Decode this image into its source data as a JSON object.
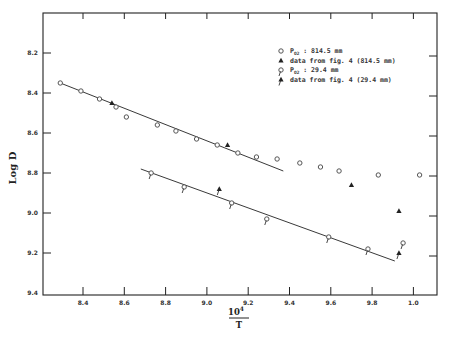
{
  "chart_data": {
    "type": "scatter",
    "title": "",
    "xlabel": "10^4 / T",
    "ylabel": "Log D",
    "xlim": [
      8.23,
      10.14
    ],
    "ylim": [
      9.4,
      8.0
    ],
    "y_inverted": true,
    "x_ticks": [
      "8.4",
      "8.6",
      "8.8",
      "9.0",
      "9.2",
      "9.4",
      "9.6",
      "9.8",
      "1.0"
    ],
    "x_tick_values": [
      8.4,
      8.6,
      8.8,
      9.0,
      9.2,
      9.4,
      9.6,
      9.8,
      10.0
    ],
    "y_ticks": [
      "8.2",
      "8.4",
      "8.6",
      "8.8",
      "9.0",
      "9.2",
      "9.4"
    ],
    "y_tick_values": [
      8.2,
      8.4,
      8.6,
      8.8,
      9.0,
      9.2,
      9.4
    ],
    "grid": false,
    "legend_position": "upper right",
    "series": [
      {
        "name": "P_O2 : 814.5 mm",
        "marker": "open-circle",
        "points": [
          [
            8.29,
            8.35
          ],
          [
            8.39,
            8.39
          ],
          [
            8.48,
            8.43
          ],
          [
            8.56,
            8.47
          ],
          [
            8.61,
            8.52
          ],
          [
            8.76,
            8.56
          ],
          [
            8.85,
            8.59
          ],
          [
            8.95,
            8.63
          ],
          [
            9.05,
            8.66
          ],
          [
            9.15,
            8.7
          ],
          [
            9.24,
            8.72
          ],
          [
            9.34,
            8.73
          ],
          [
            9.45,
            8.75
          ],
          [
            9.55,
            8.77
          ],
          [
            9.64,
            8.79
          ],
          [
            9.83,
            8.81
          ],
          [
            10.03,
            8.81
          ]
        ]
      },
      {
        "name": "data from fig. 4 (814.5 mm)",
        "marker": "filled-triangle",
        "points": [
          [
            8.54,
            8.45
          ],
          [
            9.1,
            8.66
          ],
          [
            9.7,
            8.86
          ],
          [
            9.93,
            8.99
          ]
        ]
      },
      {
        "name": "P_O2 : 29.4 mm",
        "marker": "open-circle-flag",
        "points": [
          [
            8.73,
            8.8
          ],
          [
            8.89,
            8.87
          ],
          [
            9.12,
            8.95
          ],
          [
            9.29,
            9.03
          ],
          [
            9.59,
            9.12
          ],
          [
            9.78,
            9.18
          ],
          [
            9.95,
            9.15
          ]
        ]
      },
      {
        "name": "data from fig. 4 (29.4 mm)",
        "marker": "filled-triangle-flag",
        "points": [
          [
            9.06,
            8.88
          ],
          [
            9.93,
            9.2
          ]
        ]
      }
    ],
    "fit_lines": [
      {
        "name": "fit 814.5 mm",
        "from": [
          8.29,
          8.35
        ],
        "to": [
          9.37,
          8.79
        ]
      },
      {
        "name": "fit 29.4 mm",
        "from": [
          8.68,
          8.78
        ],
        "to": [
          9.91,
          9.24
        ]
      }
    ]
  },
  "axes": {
    "ylabel": "Log D",
    "xlabel_num": "10",
    "xlabel_exp": "4",
    "xlabel_den": "T"
  },
  "legend": {
    "items": [
      {
        "prefix": "P",
        "sub": "O2",
        "text": " : 814.5 mm"
      },
      {
        "prefix": "",
        "sub": "",
        "text": "data from fig. 4  (814.5 mm)"
      },
      {
        "prefix": "P",
        "sub": "O2",
        "text": " : 29.4 mm"
      },
      {
        "prefix": "",
        "sub": "",
        "text": "data from fig. 4  (29.4 mm)"
      }
    ]
  },
  "colors": {
    "ink": "#222222",
    "marker": "#555555",
    "background": "#ffffff"
  }
}
